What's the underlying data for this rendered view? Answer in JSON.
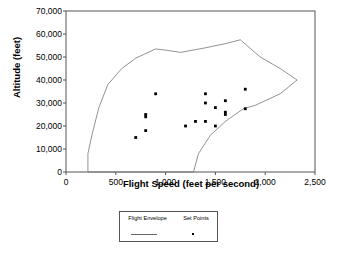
{
  "chart_data": {
    "type": "scatter",
    "title": "",
    "xlabel": "Flight Speed (feet per second)",
    "ylabel": "Altitude (feet)",
    "xlim": [
      0,
      2500
    ],
    "ylim": [
      0,
      70000
    ],
    "xticks": [
      "0",
      "500",
      "1,000",
      "1,500",
      "2,000",
      "2,500"
    ],
    "xtick_values": [
      0,
      500,
      1000,
      1500,
      2000,
      2500
    ],
    "yticks": [
      "0",
      "10,000",
      "20,000",
      "30,000",
      "40,000",
      "50,000",
      "60,000",
      "70,000"
    ],
    "ytick_values": [
      0,
      10000,
      20000,
      30000,
      40000,
      50000,
      60000,
      70000
    ],
    "grid": false,
    "legend_position": "below-center",
    "series": [
      {
        "name": "Flight Envelope",
        "type": "line",
        "color": "#777777",
        "closed": true,
        "points": [
          [
            220,
            0
          ],
          [
            220,
            8000
          ],
          [
            260,
            16000
          ],
          [
            330,
            28000
          ],
          [
            420,
            38000
          ],
          [
            560,
            45000
          ],
          [
            700,
            49500
          ],
          [
            900,
            53500
          ],
          [
            1000,
            53000
          ],
          [
            1150,
            52000
          ],
          [
            1400,
            54000
          ],
          [
            1620,
            56000
          ],
          [
            1750,
            57500
          ],
          [
            1950,
            50000
          ],
          [
            2150,
            45000
          ],
          [
            2320,
            40000
          ],
          [
            2150,
            34000
          ],
          [
            1900,
            29000
          ],
          [
            1780,
            27500
          ],
          [
            1600,
            22000
          ],
          [
            1450,
            16000
          ],
          [
            1330,
            8000
          ],
          [
            1280,
            0
          ]
        ]
      },
      {
        "name": "Set Points",
        "type": "scatter",
        "color": "#000000",
        "points": [
          [
            700,
            15000
          ],
          [
            800,
            18000
          ],
          [
            800,
            24000
          ],
          [
            800,
            25000
          ],
          [
            900,
            34000
          ],
          [
            1200,
            20000
          ],
          [
            1300,
            22000
          ],
          [
            1400,
            22000
          ],
          [
            1400,
            30000
          ],
          [
            1400,
            34000
          ],
          [
            1500,
            20000
          ],
          [
            1500,
            28000
          ],
          [
            1600,
            25000
          ],
          [
            1600,
            26000
          ],
          [
            1600,
            31000
          ],
          [
            1800,
            27500
          ],
          [
            1800,
            36000
          ]
        ]
      }
    ],
    "legend": [
      {
        "label": "Flight Envelope",
        "marker": "line"
      },
      {
        "label": "Set Points",
        "marker": "square"
      }
    ]
  }
}
